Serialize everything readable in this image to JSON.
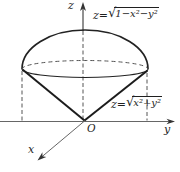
{
  "labels": {
    "z_axis": "z",
    "y_axis": "y",
    "x_axis": "x",
    "origin": "O"
  },
  "equations": {
    "hemisphere": {
      "lhs": "z=",
      "radical": "√",
      "radicand": "1−x²−y²"
    },
    "cone": {
      "lhs": "z=",
      "radical": "√",
      "radicand": "x²+y²"
    }
  },
  "colors": {
    "background": "#ffffff",
    "solid_line": "#1f1f1f",
    "dashed_line": "#555555",
    "axis_line": "#666666",
    "text": "#1f1f1f"
  }
}
